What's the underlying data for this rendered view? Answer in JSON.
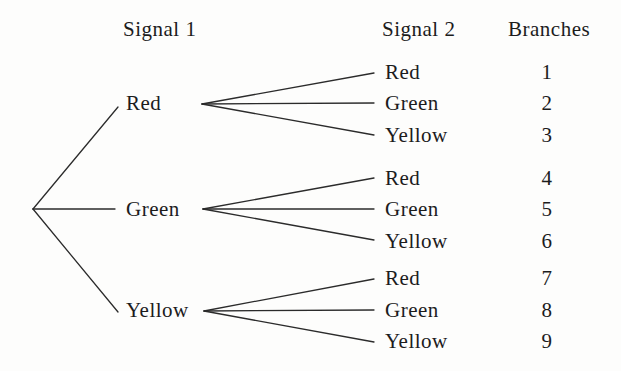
{
  "figure": {
    "headers": {
      "signal1": "Signal 1",
      "signal2": "Signal 2",
      "branches": "Branches"
    },
    "colors": {
      "background": "#fdfdfc",
      "ink": "#1c1c1c",
      "line": "#2b2b2b"
    },
    "groups": [
      {
        "parent": "Red",
        "children": [
          "Red",
          "Green",
          "Yellow"
        ],
        "branches": [
          "1",
          "2",
          "3"
        ]
      },
      {
        "parent": "Green",
        "children": [
          "Red",
          "Green",
          "Yellow"
        ],
        "branches": [
          "4",
          "5",
          "6"
        ]
      },
      {
        "parent": "Yellow",
        "children": [
          "Red",
          "Green",
          "Yellow"
        ],
        "branches": [
          "7",
          "8",
          "9"
        ]
      }
    ]
  }
}
